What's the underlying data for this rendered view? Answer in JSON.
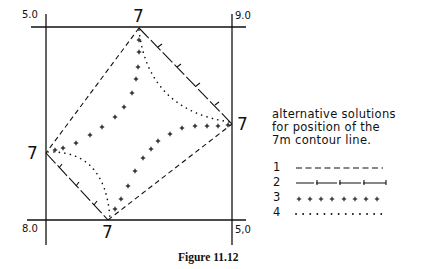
{
  "figure": {
    "caption": "Figure 11.12",
    "corner_values": {
      "top_left": "5.0",
      "top_right": "9.0",
      "bottom_left": "8.0",
      "bottom_right": "5,0"
    },
    "contour_labels": {
      "top": "7",
      "right": "7",
      "left": "7",
      "bottom": "7"
    },
    "note": {
      "line1": "alternative solutions",
      "line2": "for position of the",
      "line3": "7m contour line."
    },
    "legend": [
      {
        "number": "1",
        "style": "dashed"
      },
      {
        "number": "2",
        "style": "dash-tick"
      },
      {
        "number": "3",
        "style": "plus-marks"
      },
      {
        "number": "4",
        "style": "dotted"
      }
    ],
    "line_color": "#111111"
  }
}
